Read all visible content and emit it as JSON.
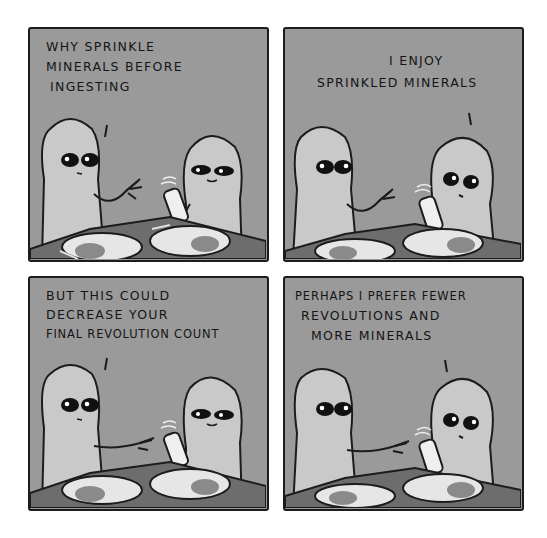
{
  "comic": {
    "panels": [
      {
        "id": "panel-1",
        "speaker": "left",
        "lines": [
          "WHY SPRINKLE",
          "MINERALS BEFORE",
          "INGESTING"
        ],
        "line_positions": [
          [
            16,
            14
          ],
          [
            16,
            34
          ],
          [
            22,
            55
          ]
        ]
      },
      {
        "id": "panel-2",
        "speaker": "right",
        "lines": [
          "I ENJOY",
          "SPRINKLED MINERALS"
        ],
        "line_positions": [
          [
            106,
            24
          ],
          [
            36,
            46
          ]
        ]
      },
      {
        "id": "panel-3",
        "speaker": "left",
        "lines": [
          "BUT THIS COULD",
          "DECREASE YOUR",
          "FINAL REVOLUTION COUNT"
        ],
        "line_positions": [
          [
            16,
            16
          ],
          [
            16,
            35
          ],
          [
            16,
            54
          ]
        ]
      },
      {
        "id": "panel-4",
        "speaker": "right",
        "lines": [
          "PERHAPS I PREFER FEWER",
          "REVOLUTIONS AND",
          "MORE MINERALS"
        ],
        "line_positions": [
          [
            12,
            14
          ],
          [
            16,
            34
          ],
          [
            26,
            54
          ]
        ]
      }
    ],
    "colors": {
      "panel_bg": "#9a9a9a",
      "alien_body": "#c9c9c9",
      "outline": "#1c1c1c",
      "table": "#6d6d6d",
      "plate": "#e6e6e6"
    }
  }
}
